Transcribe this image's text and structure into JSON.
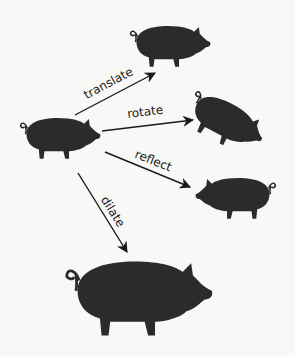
{
  "diagram": {
    "title": "",
    "colors": {
      "pig": "#2b2b2b",
      "arrow": "#1a1a1a",
      "background": "#f8f8f6"
    },
    "nodes": [
      {
        "id": "original",
        "label": "original pig"
      },
      {
        "id": "translated",
        "label": "translated pig"
      },
      {
        "id": "rotated",
        "label": "rotated pig"
      },
      {
        "id": "reflected",
        "label": "reflected pig"
      },
      {
        "id": "dilated",
        "label": "dilated pig"
      }
    ],
    "edges": [
      {
        "from": "original",
        "to": "translated",
        "label": "translate"
      },
      {
        "from": "original",
        "to": "rotated",
        "label": "rotate"
      },
      {
        "from": "original",
        "to": "reflected",
        "label": "reflect"
      },
      {
        "from": "original",
        "to": "dilated",
        "label": "dilate"
      }
    ]
  }
}
